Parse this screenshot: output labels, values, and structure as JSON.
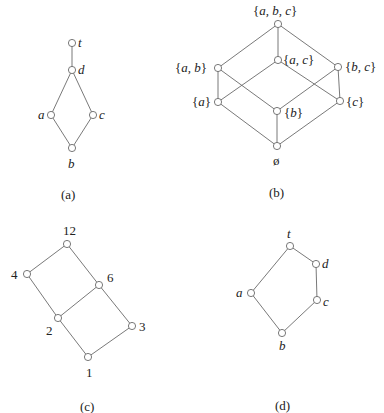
{
  "diagrams": {
    "a": {
      "caption": "(a)",
      "nodes": {
        "t": {
          "label": "t"
        },
        "d": {
          "label": "d"
        },
        "a": {
          "label": "a"
        },
        "c": {
          "label": "c"
        },
        "b": {
          "label": "b"
        }
      },
      "edges": [
        [
          "t",
          "d"
        ],
        [
          "d",
          "a"
        ],
        [
          "d",
          "c"
        ],
        [
          "a",
          "b"
        ],
        [
          "c",
          "b"
        ]
      ]
    },
    "b": {
      "caption": "(b)",
      "nodes": {
        "abc": {
          "label_open": "{",
          "label_body": "a, b, c",
          "label_close": "}"
        },
        "ab": {
          "label_open": "{",
          "label_body": "a, b",
          "label_close": "}"
        },
        "ac": {
          "label_open": "{",
          "label_body": "a, c",
          "label_close": "}"
        },
        "bc": {
          "label_open": "{",
          "label_body": "b, c",
          "label_close": "}"
        },
        "a": {
          "label_open": "{",
          "label_body": "a",
          "label_close": "}"
        },
        "b": {
          "label_open": "{",
          "label_body": "b",
          "label_close": "}"
        },
        "c": {
          "label_open": "{",
          "label_body": "c",
          "label_close": "}"
        },
        "empty": {
          "label": "ø"
        }
      },
      "edges": [
        [
          "abc",
          "ab"
        ],
        [
          "abc",
          "ac"
        ],
        [
          "abc",
          "bc"
        ],
        [
          "ab",
          "a"
        ],
        [
          "ab",
          "b"
        ],
        [
          "ac",
          "a"
        ],
        [
          "ac",
          "c"
        ],
        [
          "bc",
          "b"
        ],
        [
          "bc",
          "c"
        ],
        [
          "a",
          "empty"
        ],
        [
          "b",
          "empty"
        ],
        [
          "c",
          "empty"
        ]
      ]
    },
    "c": {
      "caption": "(c)",
      "nodes": {
        "n12": {
          "label": "12"
        },
        "n4": {
          "label": "4"
        },
        "n6": {
          "label": "6"
        },
        "n2": {
          "label": "2"
        },
        "n3": {
          "label": "3"
        },
        "n1": {
          "label": "1"
        }
      },
      "edges": [
        [
          "12",
          "4"
        ],
        [
          "12",
          "6"
        ],
        [
          "4",
          "2"
        ],
        [
          "6",
          "2"
        ],
        [
          "6",
          "3"
        ],
        [
          "2",
          "1"
        ],
        [
          "3",
          "1"
        ]
      ]
    },
    "d": {
      "caption": "(d)",
      "nodes": {
        "t": {
          "label": "t"
        },
        "d": {
          "label": "d"
        },
        "a": {
          "label": "a"
        },
        "c": {
          "label": "c"
        },
        "b": {
          "label": "b"
        }
      },
      "edges": [
        [
          "t",
          "a"
        ],
        [
          "t",
          "d"
        ],
        [
          "d",
          "c"
        ],
        [
          "a",
          "b"
        ],
        [
          "c",
          "b"
        ]
      ]
    }
  }
}
